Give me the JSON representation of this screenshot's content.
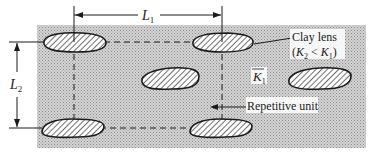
{
  "diagram": {
    "type": "periodic clay lens layout",
    "colors": {
      "background": "#ffffff",
      "matrix_fill": "#c9c9c9",
      "lens_stroke": "#1a1a1a",
      "ink": "#1a1a1a"
    },
    "dimensions": {
      "horizontal": {
        "symbol": "L",
        "sub": "1"
      },
      "vertical": {
        "symbol": "L",
        "sub": "2"
      }
    },
    "labels": {
      "clay_lens_line1": "Clay lens",
      "clay_lens_line2_open": "(",
      "clay_lens_k2": "K",
      "clay_lens_k2_sub": "2",
      "clay_lens_lt": " < ",
      "clay_lens_k1": "K",
      "clay_lens_k1_sub": "1",
      "clay_lens_line2_close": ")",
      "matrix_k": "K",
      "matrix_k_sub": "1",
      "repetitive_unit": "Repetitive unit"
    },
    "lenses": [
      {
        "id": "top-left"
      },
      {
        "id": "top-right"
      },
      {
        "id": "center"
      },
      {
        "id": "right"
      },
      {
        "id": "bottom-left"
      },
      {
        "id": "bottom-right"
      }
    ]
  }
}
